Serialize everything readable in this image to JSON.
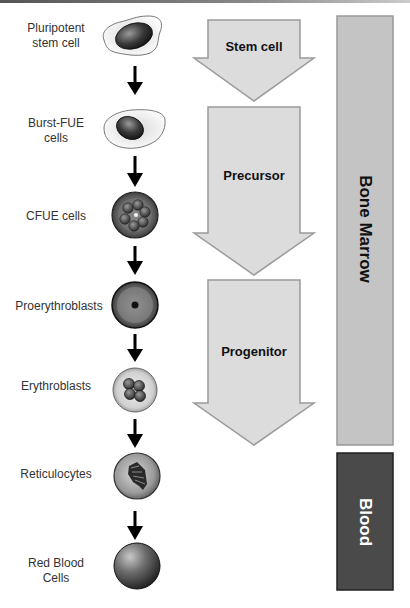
{
  "diagram": {
    "cells": [
      {
        "id": "pluripotent",
        "label_line1": "Pluripotent",
        "label_line2": "stem cell"
      },
      {
        "id": "burst-fue",
        "label_line1": "Burst-FUE",
        "label_line2": "cells"
      },
      {
        "id": "cfue",
        "label_line1": "CFUE cells",
        "label_line2": ""
      },
      {
        "id": "proerythroblasts",
        "label_line1": "Proerythroblasts",
        "label_line2": ""
      },
      {
        "id": "erythroblasts",
        "label_line1": "Erythroblasts",
        "label_line2": ""
      },
      {
        "id": "reticulocytes",
        "label_line1": "Reticulocytes",
        "label_line2": ""
      },
      {
        "id": "rbc",
        "label_line1": "Red Blood",
        "label_line2": "Cells"
      }
    ],
    "stages": [
      {
        "label": "Stem cell"
      },
      {
        "label": "Precursor"
      },
      {
        "label": "Progenitor"
      }
    ],
    "regions": [
      {
        "label": "Bone Marrow",
        "color": "#c4c4c4",
        "text_color": "#111111"
      },
      {
        "label": "Blood",
        "color": "#4a4a4a",
        "text_color": "#ffffff"
      }
    ],
    "colors": {
      "stage_arrow_fill": "#dcdcdc",
      "stage_arrow_stroke": "#9a9a9a",
      "flow_arrow": "#000000"
    }
  }
}
